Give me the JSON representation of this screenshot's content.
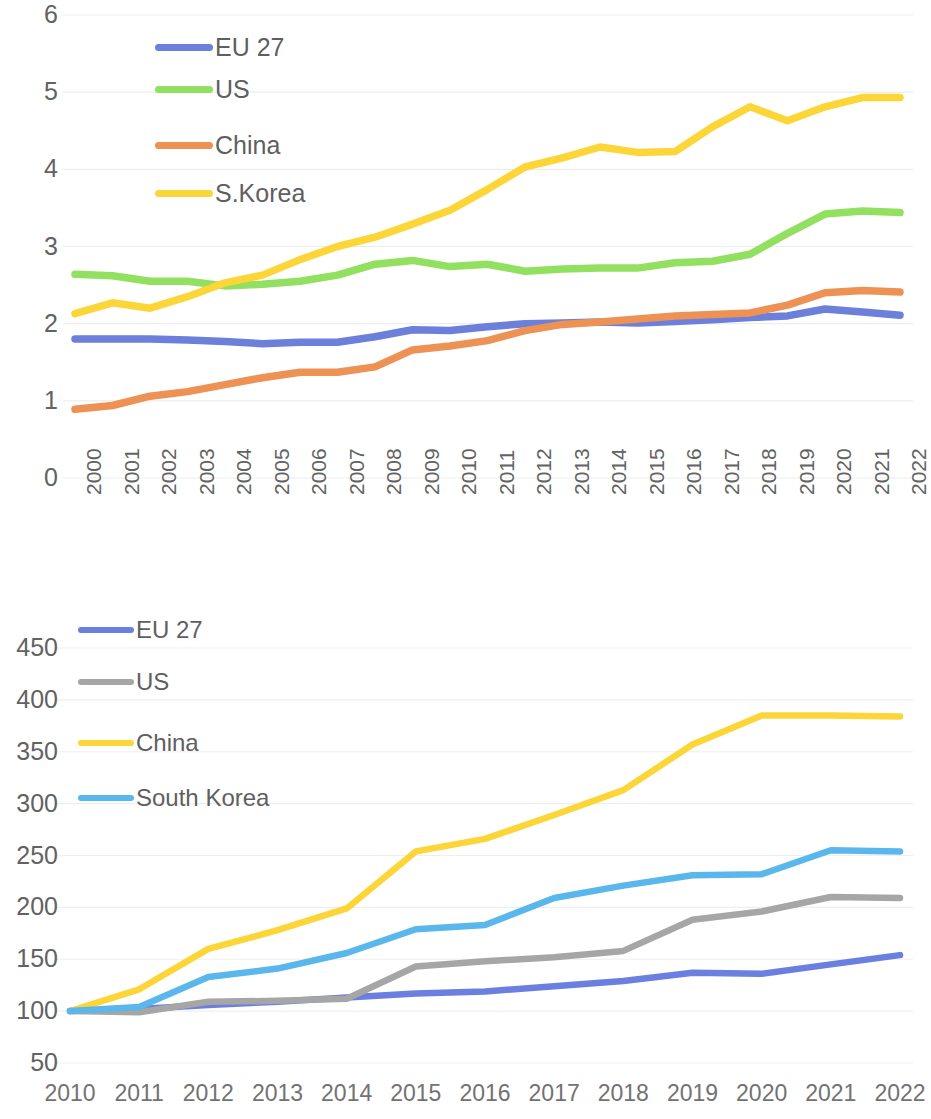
{
  "chart_data": [
    {
      "id": "chart-top",
      "type": "line",
      "title": "",
      "xlabel": "",
      "ylabel": "",
      "grid": true,
      "legend_position": "inside-top-left",
      "ylim": [
        0,
        6
      ],
      "yticks": [
        6,
        5,
        4,
        3,
        2,
        1,
        0
      ],
      "categories": [
        "2000",
        "2001",
        "2002",
        "2003",
        "2004",
        "2005",
        "2006",
        "2007",
        "2008",
        "2009",
        "2010",
        "2011",
        "2012",
        "2013",
        "2014",
        "2015",
        "2016",
        "2017",
        "2018",
        "2019",
        "2020",
        "2021",
        "2022"
      ],
      "series": [
        {
          "name": "EU 27",
          "color": "#6b7fdb",
          "values": [
            1.8,
            1.8,
            1.8,
            1.79,
            1.77,
            1.74,
            1.76,
            1.76,
            1.83,
            1.92,
            1.91,
            1.96,
            2.0,
            2.01,
            2.02,
            2.01,
            2.03,
            2.05,
            2.08,
            2.1,
            2.19,
            2.15,
            2.11
          ]
        },
        {
          "name": "US",
          "color": "#92e060",
          "values": [
            2.64,
            2.62,
            2.55,
            2.55,
            2.49,
            2.51,
            2.55,
            2.63,
            2.77,
            2.82,
            2.74,
            2.77,
            2.68,
            2.71,
            2.72,
            2.72,
            2.79,
            2.81,
            2.9,
            3.17,
            3.42,
            3.46,
            3.44
          ]
        },
        {
          "name": "China",
          "color": "#ed9254",
          "values": [
            0.89,
            0.94,
            1.06,
            1.12,
            1.21,
            1.3,
            1.37,
            1.37,
            1.44,
            1.66,
            1.71,
            1.78,
            1.91,
            1.99,
            2.02,
            2.06,
            2.1,
            2.12,
            2.14,
            2.24,
            2.4,
            2.43,
            2.41
          ]
        },
        {
          "name": "S.Korea",
          "color": "#fcd638",
          "values": [
            2.13,
            2.27,
            2.2,
            2.35,
            2.53,
            2.63,
            2.83,
            3.0,
            3.12,
            3.29,
            3.47,
            3.74,
            4.03,
            4.15,
            4.29,
            4.22,
            4.23,
            4.55,
            4.81,
            4.63,
            4.81,
            4.93,
            4.93
          ]
        }
      ]
    },
    {
      "id": "chart-bottom",
      "type": "line",
      "title": "",
      "xlabel": "",
      "ylabel": "",
      "grid": true,
      "legend_position": "inside-top-left",
      "ylim": [
        50,
        475
      ],
      "yticks": [
        450,
        400,
        350,
        300,
        250,
        200,
        150,
        100,
        50
      ],
      "categories": [
        "2010",
        "2011",
        "2012",
        "2013",
        "2014",
        "2015",
        "2016",
        "2017",
        "2018",
        "2019",
        "2020",
        "2021",
        "2022"
      ],
      "series": [
        {
          "name": "EU 27",
          "color": "#6b7fe0",
          "values": [
            100,
            102,
            106,
            109,
            113,
            117,
            119,
            124,
            129,
            137,
            136,
            145,
            154
          ]
        },
        {
          "name": "US",
          "color": "#a6a6a6",
          "values": [
            100,
            99,
            109,
            110,
            112,
            143,
            148,
            152,
            158,
            188,
            196,
            210,
            209
          ]
        },
        {
          "name": "China",
          "color": "#fcd638",
          "values": [
            100,
            121,
            160,
            178,
            199,
            254,
            266,
            289,
            313,
            357,
            385,
            385,
            384
          ]
        },
        {
          "name": "South Korea",
          "color": "#5ab7ec",
          "values": [
            100,
            104,
            133,
            141,
            156,
            179,
            183,
            209,
            221,
            231,
            232,
            255,
            254
          ]
        }
      ]
    }
  ],
  "chart_top": {
    "yticks": [
      "6",
      "5",
      "4",
      "3",
      "2",
      "1",
      "0"
    ],
    "xticks": [
      "2000",
      "2001",
      "2002",
      "2003",
      "2004",
      "2005",
      "2006",
      "2007",
      "2008",
      "2009",
      "2010",
      "2011",
      "2012",
      "2013",
      "2014",
      "2015",
      "2016",
      "2017",
      "2018",
      "2019",
      "2020",
      "2021",
      "2022"
    ],
    "legend": [
      {
        "label": "EU 27",
        "color": "#6b7fdb"
      },
      {
        "label": "US",
        "color": "#92e060"
      },
      {
        "label": "China",
        "color": "#ed9254"
      },
      {
        "label": "S.Korea",
        "color": "#fcd638"
      }
    ]
  },
  "chart_bottom": {
    "yticks": [
      "450",
      "400",
      "350",
      "300",
      "250",
      "200",
      "150",
      "100",
      "50"
    ],
    "xticks": [
      "2010",
      "2011",
      "2012",
      "2013",
      "2014",
      "2015",
      "2016",
      "2017",
      "2018",
      "2019",
      "2020",
      "2021",
      "2022"
    ],
    "legend": [
      {
        "label": "EU 27",
        "color": "#6b7fe0"
      },
      {
        "label": "US",
        "color": "#a6a6a6"
      },
      {
        "label": "China",
        "color": "#fcd638"
      },
      {
        "label": "South Korea",
        "color": "#5ab7ec"
      }
    ]
  }
}
